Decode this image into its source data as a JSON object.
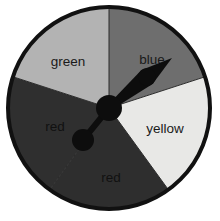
{
  "figure": {
    "kind": "probability-spinner",
    "background_color": "#ffffff"
  },
  "wheel": {
    "center_x": 109,
    "center_y": 108,
    "radius": 101,
    "outline_color": "#111111",
    "outline_width": 4,
    "divider_color": "#2b2b2b",
    "divider_width": 1
  },
  "chart_data": {
    "type": "pie",
    "title": "",
    "legend": "none",
    "categories": [
      "blue",
      "yellow",
      "red",
      "red",
      "green"
    ],
    "values": [
      72,
      72,
      72,
      72,
      72
    ],
    "unit": "degrees",
    "start_angles": [
      0,
      72,
      144,
      216,
      288
    ],
    "end_angles": [
      72,
      144,
      216,
      288,
      360
    ],
    "colors": [
      "#6e6e6e",
      "#e8e8e6",
      "#2e2e2e",
      "#2f2f2f",
      "#b3b3b3"
    ]
  },
  "sectors": [
    {
      "name": "blue",
      "label": "blue",
      "fill": "#6e6e6e",
      "start_angle": 0,
      "end_angle": 72,
      "label_x": 152,
      "label_y": 60,
      "label_class": "sector-label"
    },
    {
      "name": "yellow",
      "label": "yellow",
      "fill": "#e8e8e6",
      "start_angle": 72,
      "end_angle": 144,
      "label_x": 165,
      "label_y": 129,
      "label_class": "sector-label"
    },
    {
      "name": "red-right",
      "label": "red",
      "fill": "#2e2e2e",
      "start_angle": 144,
      "end_angle": 216,
      "label_x": 111,
      "label_y": 178,
      "label_class": "sector-label on-dark"
    },
    {
      "name": "red-left",
      "label": "red",
      "fill": "#2f2f2f",
      "start_angle": 216,
      "end_angle": 288,
      "label_x": 55,
      "label_y": 127,
      "label_class": "sector-label on-dark"
    },
    {
      "name": "green",
      "label": "green",
      "fill": "#b3b3b3",
      "start_angle": 288,
      "end_angle": 360,
      "label_x": 68,
      "label_y": 62,
      "label_class": "sector-label"
    }
  ],
  "pointer": {
    "color": "#0d0d0d",
    "hub_x": 109,
    "hub_y": 108,
    "hub_radius": 13,
    "arm_pointed": {
      "tip_x": 172,
      "tip_y": 58,
      "bulge_x": 147,
      "bulge_y": 77,
      "bulge_radius": 9,
      "shaft_width": 6
    },
    "arm_knob": {
      "knob_x": 83,
      "knob_y": 140,
      "knob_radius": 11,
      "shaft_width": 6
    }
  }
}
